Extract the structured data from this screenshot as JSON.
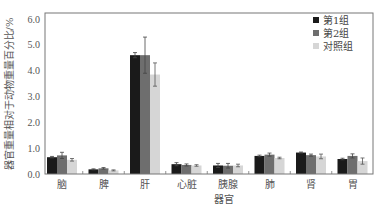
{
  "chart_data": {
    "type": "bar",
    "title": "",
    "xlabel": "器官",
    "ylabel": "器官重量相对于动物重量百分比/%",
    "ylim": [
      0.0,
      6.0
    ],
    "yticks": [
      "0.0",
      "1.0",
      "2.0",
      "3.0",
      "4.0",
      "5.0",
      "6.0"
    ],
    "categories": [
      "脑",
      "脾",
      "肝",
      "心脏",
      "胰腺",
      "肺",
      "肾",
      "胃"
    ],
    "series": [
      {
        "name": "第1组",
        "color": "#1a1a1a",
        "values": [
          0.65,
          0.18,
          4.6,
          0.38,
          0.33,
          0.7,
          0.83,
          0.58
        ],
        "errors": [
          0.03,
          0.02,
          0.1,
          0.06,
          0.08,
          0.03,
          0.02,
          0.03
        ]
      },
      {
        "name": "第2组",
        "color": "#6e6e6e",
        "values": [
          0.72,
          0.22,
          4.6,
          0.35,
          0.32,
          0.75,
          0.73,
          0.7
        ],
        "errors": [
          0.12,
          0.03,
          0.7,
          0.04,
          0.09,
          0.06,
          0.04,
          0.08
        ]
      },
      {
        "name": "对照组",
        "color": "#d6d6d6",
        "values": [
          0.55,
          0.14,
          3.85,
          0.33,
          0.33,
          0.62,
          0.68,
          0.5
        ],
        "errors": [
          0.05,
          0.02,
          0.45,
          0.03,
          0.05,
          0.03,
          0.09,
          0.12
        ]
      }
    ],
    "grid": false,
    "legend_position": "upper right"
  }
}
